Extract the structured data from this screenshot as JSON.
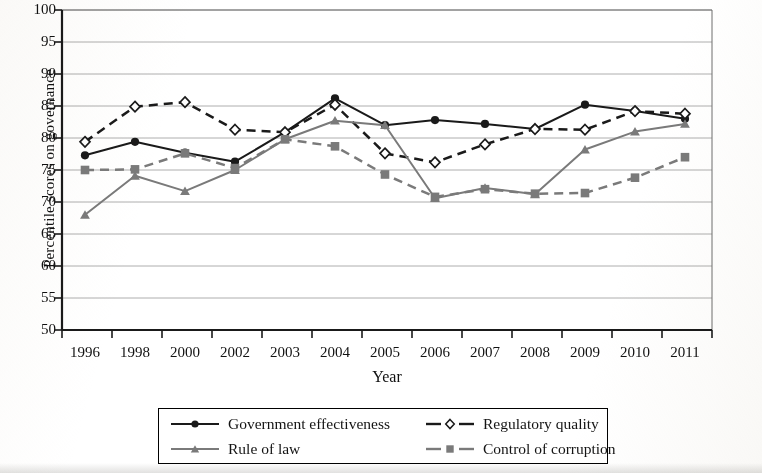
{
  "chart_data": {
    "type": "line",
    "title": "",
    "xlabel": "Year",
    "ylabel": "Percentile scores on governance",
    "categories": [
      "1996",
      "1998",
      "2000",
      "2002",
      "2003",
      "2004",
      "2005",
      "2006",
      "2007",
      "2008",
      "2009",
      "2010",
      "2011"
    ],
    "ylim": [
      50,
      100
    ],
    "ytick_step": 5,
    "yticks": [
      "100",
      "95",
      "90",
      "85",
      "80",
      "75",
      "70",
      "65",
      "60",
      "55",
      "50"
    ],
    "grid": "horizontal",
    "legend_position": "bottom",
    "series": [
      {
        "name": "Government effectiveness",
        "marker": "filled-circle",
        "line": "solid",
        "color": "#1a1a1a",
        "values": [
          77.3,
          79.4,
          77.7,
          76.3,
          80.9,
          86.2,
          82.0,
          82.8,
          82.2,
          81.4,
          85.2,
          84.2,
          83.0
        ]
      },
      {
        "name": "Regulatory quality",
        "marker": "open-diamond",
        "line": "dashed",
        "color": "#1a1a1a",
        "values": [
          79.4,
          84.9,
          85.6,
          81.3,
          80.9,
          85.2,
          77.6,
          76.2,
          79.0,
          81.4,
          81.3,
          84.2,
          83.8
        ]
      },
      {
        "name": "Rule of law",
        "marker": "filled-triangle",
        "line": "solid",
        "color": "#7a7a7a",
        "values": [
          68.0,
          74.1,
          71.7,
          75.0,
          79.8,
          82.7,
          82.0,
          70.6,
          72.2,
          71.2,
          78.2,
          81.0,
          82.2
        ]
      },
      {
        "name": "Control of corruption",
        "marker": "filled-square",
        "line": "dashed",
        "color": "#7a7a7a",
        "values": [
          75.0,
          75.1,
          77.6,
          75.3,
          79.8,
          78.7,
          74.3,
          70.8,
          72.0,
          71.3,
          71.4,
          73.8,
          77.0
        ]
      }
    ]
  },
  "legend": {
    "items": [
      {
        "label": "Government effectiveness"
      },
      {
        "label": "Regulatory quality"
      },
      {
        "label": "Rule of law"
      },
      {
        "label": "Control of corruption"
      }
    ]
  }
}
